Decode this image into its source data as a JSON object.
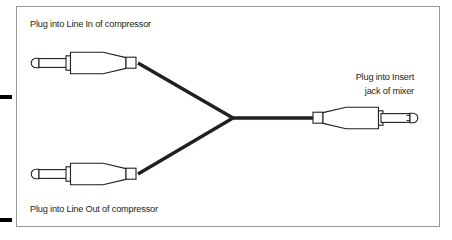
{
  "figure": {
    "name": "insert-cable-wiring-diagram",
    "background_color": "#ffffff",
    "frame": {
      "stroke_color": "#9a9a9a",
      "x": 16,
      "y": 6,
      "width": 424,
      "height": 221
    },
    "crop_marks": {
      "color": "#000000",
      "count": 2
    },
    "cable": {
      "stroke_color": "#231f20",
      "junction_x": 232,
      "junction_y": 118
    },
    "plug": {
      "outline_color": "#231f20",
      "fill_color": "#ffffff",
      "type": "quarter-inch-ts-phone-plug"
    }
  },
  "labels": {
    "top_left": {
      "text": "Plug into Line In of compressor",
      "x": 30,
      "y": 27,
      "anchor": "start"
    },
    "bottom_left": {
      "text": "Plug into Line Out of compressor",
      "x": 30,
      "y": 212,
      "anchor": "start"
    },
    "right_line1": {
      "text": "Plug into Insert",
      "x": 414,
      "y": 80,
      "anchor": "end"
    },
    "right_line2": {
      "text": "jack of mixer",
      "x": 414,
      "y": 94,
      "anchor": "end"
    }
  },
  "connectors": [
    {
      "id": "line-in-plug",
      "label": "Plug into Line In of compressor",
      "position": "top-left",
      "orientation": "tip-left"
    },
    {
      "id": "line-out-plug",
      "label": "Plug into Line Out of compressor",
      "position": "bottom-left",
      "orientation": "tip-left"
    },
    {
      "id": "insert-plug",
      "label": "Plug into Insert jack of mixer",
      "position": "right",
      "orientation": "tip-right"
    }
  ]
}
